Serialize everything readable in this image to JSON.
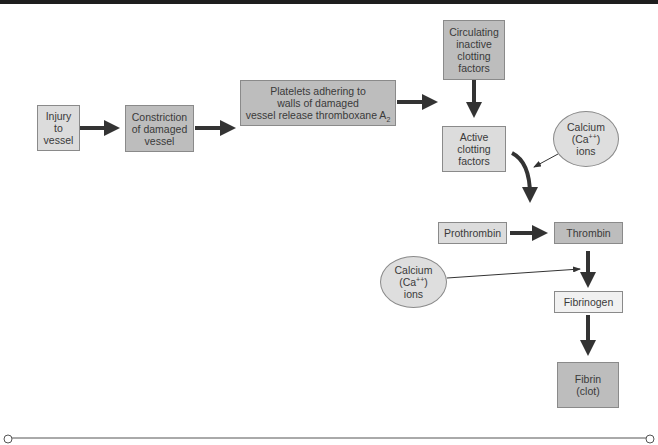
{
  "diagram": {
    "colors": {
      "top_bar": "#1e1e1e",
      "box_light": "#dcdcdc",
      "box_mid": "#bdbdbd",
      "box_pale": "#f1f1f1",
      "ellipse": "#dedede",
      "arrow": "#333333",
      "border": "#8a8a8a"
    },
    "nodes": {
      "injury": {
        "lines": [
          "Injury",
          "to",
          "vessel"
        ]
      },
      "constriction": {
        "lines": [
          "Constriction",
          "of damaged",
          "vessel"
        ]
      },
      "platelets": {
        "line1": "Platelets adhering to",
        "line2": "walls of damaged",
        "line3_prefix": "vessel release thromboxane A",
        "line3_sub": "2"
      },
      "circulating": {
        "lines": [
          "Circulating",
          "inactive",
          "clotting",
          "factors"
        ]
      },
      "active": {
        "lines": [
          "Active",
          "clotting",
          "factors"
        ]
      },
      "calcium_top": {
        "line1": "Calcium",
        "line2_prefix": "(Ca",
        "line2_sup": "++",
        "line2_suffix": ")",
        "line3": "ions"
      },
      "prothrombin": {
        "label": "Prothrombin"
      },
      "thrombin": {
        "label": "Thrombin"
      },
      "calcium_bottom": {
        "line1": "Calcium",
        "line2_prefix": "(Ca",
        "line2_sup": "++",
        "line2_suffix": ")",
        "line3": "ions"
      },
      "fibrinogen": {
        "label": "Fibrinogen"
      },
      "fibrin": {
        "lines": [
          "Fibrin",
          "(clot)"
        ]
      }
    },
    "edges": [
      {
        "from": "injury",
        "to": "constriction",
        "type": "thick"
      },
      {
        "from": "constriction",
        "to": "platelets",
        "type": "thick"
      },
      {
        "from": "platelets",
        "to": "active",
        "type": "thick"
      },
      {
        "from": "circulating",
        "to": "active",
        "type": "thick"
      },
      {
        "from": "active",
        "to": "prothrombin-thrombin",
        "type": "thick-curved"
      },
      {
        "from": "calcium_top",
        "to": "active-curve",
        "type": "thin"
      },
      {
        "from": "prothrombin",
        "to": "thrombin",
        "type": "thick"
      },
      {
        "from": "thrombin",
        "to": "fibrinogen",
        "type": "thick"
      },
      {
        "from": "calcium_bottom",
        "to": "thrombin-fibrinogen",
        "type": "thin"
      },
      {
        "from": "fibrinogen",
        "to": "fibrin",
        "type": "thick"
      }
    ]
  }
}
